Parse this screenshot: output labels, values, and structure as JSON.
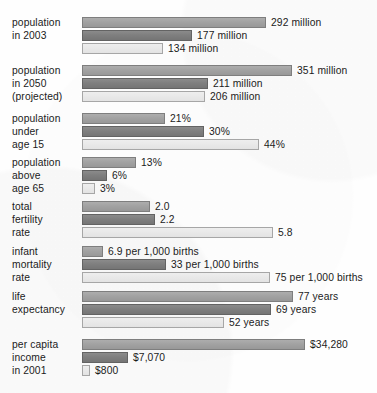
{
  "chart_data": {
    "type": "bar",
    "title": "",
    "subtitle": "",
    "xlabel": "",
    "ylabel": "",
    "orientation": "horizontal",
    "grid": false,
    "legend_position": "none",
    "layout_note": "Grouped horizontal bar chart; each metric group is scaled independently to its own maximum. Three unlabeled series per group rendered light-gray, dark-gray, and very-light-gray top to bottom.",
    "series": [
      {
        "name": "series-1",
        "color": "#a2a2a2"
      },
      {
        "name": "series-2",
        "color": "#7f7f7f"
      },
      {
        "name": "series-3",
        "color": "#e9e9e9"
      }
    ],
    "categories": [
      "population in 2003",
      "population in 2050 (projected)",
      "population under age 15",
      "population above age 65",
      "total fertility rate",
      "infant mortality rate",
      "life expectancy",
      "per capita income in 2001"
    ],
    "groups": [
      {
        "id": "population-in-2003",
        "label_lines": [
          "population",
          "in 2003"
        ],
        "unit": "million",
        "values": [
          292,
          177,
          134
        ],
        "value_labels": [
          "292 million",
          "177 million",
          "134 million"
        ],
        "bar_px": [
          184,
          110,
          81
        ]
      },
      {
        "id": "population-in-2050-projected",
        "label_lines": [
          "population",
          "in 2050",
          "(projected)"
        ],
        "unit": "million",
        "values": [
          351,
          211,
          206
        ],
        "value_labels": [
          "351 million",
          "211 million",
          "206 million"
        ],
        "bar_px": [
          210,
          126,
          123
        ]
      },
      {
        "id": "population-under-age-15",
        "label_lines": [
          "population",
          "under",
          "age 15"
        ],
        "unit": "percent",
        "values": [
          21,
          30,
          44
        ],
        "value_labels": [
          "21%",
          "30%",
          "44%"
        ],
        "bar_px": [
          83,
          122,
          177
        ]
      },
      {
        "id": "population-above-age-65",
        "label_lines": [
          "population",
          "above",
          "age 65"
        ],
        "unit": "percent",
        "values": [
          13,
          6,
          3
        ],
        "value_labels": [
          "13%",
          "6%",
          "3%"
        ],
        "bar_px": [
          54,
          25,
          13
        ]
      },
      {
        "id": "total-fertility-rate",
        "label_lines": [
          "total",
          "fertility",
          "rate"
        ],
        "unit": "children per woman",
        "values": [
          2.0,
          2.2,
          5.8
        ],
        "value_labels": [
          "2.0",
          "2.2",
          "5.8"
        ],
        "bar_px": [
          68,
          73,
          191
        ]
      },
      {
        "id": "infant-mortality-rate",
        "label_lines": [
          "infant",
          "mortality",
          "rate"
        ],
        "unit": "per 1,000 births",
        "values": [
          6.9,
          33,
          75
        ],
        "value_labels": [
          "6.9 per 1,000 births",
          "33 per 1,000 births",
          "75 per 1,000 births"
        ],
        "bar_px": [
          21,
          84,
          188
        ]
      },
      {
        "id": "life-expectancy",
        "label_lines": [
          "life",
          "expectancy"
        ],
        "unit": "years",
        "values": [
          77,
          69,
          52
        ],
        "value_labels": [
          "77 years",
          "69 years",
          "52 years"
        ],
        "bar_px": [
          211,
          189,
          142
        ]
      },
      {
        "id": "per-capita-income-in-2001",
        "label_lines": [
          "per capita",
          "income",
          "in 2001"
        ],
        "unit": "US dollars",
        "values": [
          34280,
          7070,
          800
        ],
        "value_labels": [
          "$34,280",
          "$7,070",
          "$800"
        ],
        "bar_px": [
          223,
          46,
          8
        ]
      }
    ]
  }
}
